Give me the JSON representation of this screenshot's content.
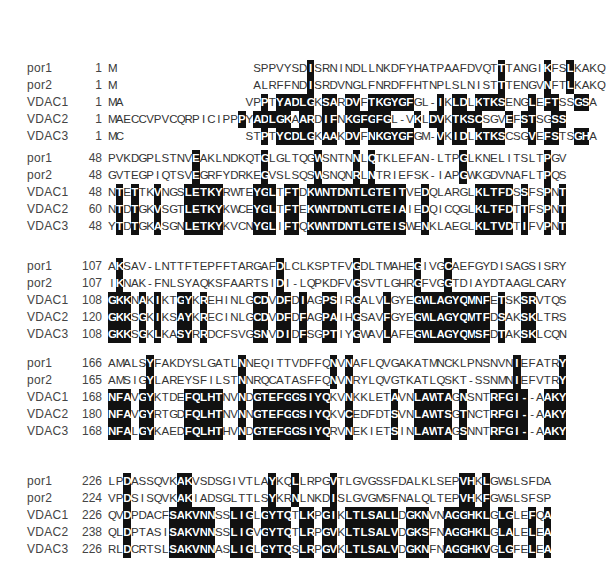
{
  "figure": {
    "type": "multiple-sequence-alignment",
    "sequences": [
      "por1",
      "por2",
      "VDAC1",
      "VDAC2",
      "VDAC3"
    ],
    "highlight_color": "#111111",
    "text_color": "#333333"
  },
  "blocks": [
    {
      "top": 60,
      "rows": [
        {
          "name": "por1",
          "start": "1",
          "seq": "M                  SPPVYSDISRNINDLLNKDFYHATPAAFDVQTTTANGIKFSLKAKQ",
          "mask": "0                  00000001000000000000000000000000100000100100000000"
        },
        {
          "name": "por2",
          "start": "1",
          "seq": "M                  ALRFFNDISRDVNGLFNRDFFHTNPLSLNISTTTENGVNFTLKAKQ",
          "mask": "0                  00000001000000000000000000000000100000100100000000"
        },
        {
          "name": "VDAC1",
          "start": "1",
          "seq": "MA                VPPTYADLGKSARDVFTKGYGFGL-IKLDLKTKSENGLEFTSSGSA",
          "mask": "00                0010111110110110111111000101101111000101100110000"
        },
        {
          "name": "VDAC2",
          "start": "1",
          "seq": "MAECCVPVCQRPICIPPPYADLGKAARDIFNKGFGFGL-VKLDVKTKSCSGVEFSTSGSS",
          "mask": "0000000000000000010111110110110111111000101101111000101100110000"
        },
        {
          "name": "VDAC3",
          "start": "1",
          "seq": "MC                STPTYCDLGKAAKDVFNKGYGFGM-VKIDLKTKSCSGVEFSTSGHA",
          "mask": "00                0010111110110110111111000101101111000101100110000"
        }
      ]
    },
    {
      "top": 150,
      "rows": [
        {
          "name": "por1",
          "start": "48",
          "seq": "PVKDGPLSTNVEAKLNDKQTGLGLTQGWSNTNNLQTKLEFAN-LTPGLKNELITSLTPGV",
          "mask": "000000000001000000001000000100001010000000000010000000000100"
        },
        {
          "name": "por2",
          "start": "48",
          "seq": "GVTEGPIQTSVEGRFYDRKEGVSLSQSWSNQNRLNTRIEFSK-IAPGWKGDVNAFLTPQS",
          "mask": "000000000001000000001000000100001010000000000010000000000100"
        },
        {
          "name": "VDAC1",
          "start": "48",
          "seq": "NTETTKVNGSLETKYRWTEYGLTFTDKWNTDNTLGTEITVEDQLARGLKLTFDSSFSPNT",
          "mask": "010100100011111000011101101111111111111001000000111110100101111"
        },
        {
          "name": "VDAC2",
          "start": "60",
          "seq": "NTDTGKVSGTLETKYKWCEYGLTFTEKWNTDNTLGTEIAIEDQICQGLKLTFDTTFSPNT",
          "mask": "010100100011111000011101101111111111111001000000111110100101111"
        },
        {
          "name": "VDAC3",
          "start": "48",
          "seq": "YTDTGKASGNLETKYKVCNYGLIFTQKWNTDNTLGTEISWENKLAEGLKLTVDTIFVPNT",
          "mask": "010100100011111000011101101111111111111001000000111110100101111"
        }
      ]
    },
    {
      "top": 258,
      "rows": [
        {
          "name": "por1",
          "start": "107",
          "seq": "AKSAV-LNTTFTEPFFTARGAFDLCLKSPTFVGDLTMAHEGIVGCAEFGYDISAGSISRY",
          "mask": "010000000000000000000010000000001000000010001000000000000000"
        },
        {
          "name": "por2",
          "start": "107",
          "seq": "IKNAK-FNLSYAQKSFAARTSIDI-LQPKDFVGSVTLGHRGFVGGTDIAYDTAAGLCARY",
          "mask": "010000000000000000000010000000001000000010001000000000000000"
        },
        {
          "name": "VDAC1",
          "start": "108",
          "seq": "GKKNAKIKTGYKREHINLGCDVDFDIAGPSIRGALVLGYEGWLAGYQMNFETSKSRVTQS",
          "mask": "111010100110100000011011010011001000100011111111110100110000"
        },
        {
          "name": "VDAC2",
          "start": "120",
          "seq": "GKKSGKIKSAYKRECINLGCDVDFDFAGPAIHGSAVFGYEGWLAGYQMTFDSAKSKLTRS",
          "mask": "111010100110100000011011010011001000100011111111110100110000"
        },
        {
          "name": "VDAC3",
          "start": "108",
          "seq": "GKKSGKLKASYRRDCFSVGSNVDIDFSGPTIYGWAVLAFEGWLAGYQMSFDTAKSKLCQN",
          "mask": "111010100110100000011011010011001000100011111111110100110000"
        }
      ]
    },
    {
      "top": 355,
      "rows": [
        {
          "name": "por1",
          "start": "166",
          "seq": "AMALSYFAKDYSLGATLNNEQITTVDFFQNVNAFLQVGAKATMNCKLPNSNVNIEFATRY",
          "mask": "000001000000000001000000000001010000000000000000000001000001"
        },
        {
          "name": "por2",
          "start": "165",
          "seq": "AMSIGYLAREYSFILSTNNRQCATASFFQNVNRYLQVGTKATLQSKT-SSNMNIEFVTRY",
          "mask": "000001000000000001000000000001010000000000000000000001000001"
        },
        {
          "name": "VDAC1",
          "start": "168",
          "seq": "NFAVGYKTDEFQLHTNVNDGTEFGGSIYQKVNKKLETAVNLAWTAGNSNTRFGI--AAKY",
          "mask": "111011000011111001011111111110010000010011111010001111100111"
        },
        {
          "name": "VDAC2",
          "start": "180",
          "seq": "NFAVGYRTGDFQLHTNVNNGTEFGGSIYQKVCEDFDTSVNLAWTSGTNCTRFGI--AAKY",
          "mask": "111011000011111001011111111110010000010011111010001111100111"
        },
        {
          "name": "VDAC3",
          "start": "168",
          "seq": "NFALGYKAEDFQLHTHVNDGTEFGGSIYQRVNEKIETSINLAWTAGSNNTRFGI--AAKY",
          "mask": "111011000011111001011111111110010000010011111010001111100111"
        }
      ]
    },
    {
      "top": 473,
      "rows": [
        {
          "name": "por1",
          "start": "226",
          "seq": "LPDASSQVKAKVSDSGIVTLAYKQLLRPGVTLGVGSSFDALKLSEPVHKLGWSLSFDA",
          "mask": "0010000001100000000001001000010000000000000000110100000000"
        },
        {
          "name": "por2",
          "start": "224",
          "seq": "VPDSISQVKAKIADSGLTTLSYKRNLNKDISLGVGMSFNALQLTEPVHKFGWSLSFSP",
          "mask": "0010000001100000000001001000010000000000000000110100000000"
        },
        {
          "name": "VDAC1",
          "start": "226",
          "seq": "QVDPDACFSAKVNNSSLIGLGYTQTLKPGIKLTLSALLDGKNVNAGGHKLGLGLEFQA",
          "mask": "0010000011111100111011110110110111111101110011111101100101"
        },
        {
          "name": "VDAC2",
          "start": "238",
          "seq": "QLDPTASISAKVNNSSLIGVGYTQTLRPGVKLTLSALVDGKSFNAGGHKLGLALELEA",
          "mask": "0010000011111100111011110110110111111101110011111101100101"
        },
        {
          "name": "VDAC3",
          "start": "226",
          "seq": "RLDCRTSLSAKVNNASLIGLGYTQSLRPGVKLTLSALVDGKNFNAGGHKVGLGFELEA",
          "mask": "0010000011111100111011110110110111111101110011111101100101"
        }
      ]
    }
  ]
}
